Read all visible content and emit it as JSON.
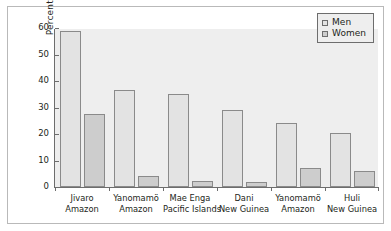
{
  "chart_data": {
    "type": "bar",
    "title": "",
    "xlabel": "",
    "ylabel": "Percentage",
    "ylim": [
      0,
      60
    ],
    "yticks": [
      0,
      10,
      20,
      30,
      40,
      50,
      60
    ],
    "grid": false,
    "legend_position": "top-right",
    "categories": [
      {
        "line1": "Jivaro",
        "line2": "Amazon"
      },
      {
        "line1": "Yanomamö",
        "line2": "Amazon"
      },
      {
        "line1": "Mae Enga",
        "line2": "Pacific Islands"
      },
      {
        "line1": "Dani",
        "line2": "New Guinea"
      },
      {
        "line1": "Yanomamö",
        "line2": "Amazon"
      },
      {
        "line1": "Huli",
        "line2": "New Guinea"
      }
    ],
    "series": [
      {
        "name": "Men",
        "color": "#e3e3e3",
        "values": [
          59,
          36.5,
          35,
          29,
          24,
          20.2
        ]
      },
      {
        "name": "Women",
        "color": "#cdcdcd",
        "values": [
          27.5,
          4.1,
          2.2,
          2,
          7.1,
          6
        ]
      }
    ]
  },
  "legend": {
    "items": [
      {
        "label": "Men",
        "swatch": "men-swatch"
      },
      {
        "label": "Women",
        "swatch": "women-swatch"
      }
    ]
  },
  "axes": {
    "y_label": "Percentage",
    "y_ticks": [
      "0",
      "10",
      "20",
      "30",
      "40",
      "50",
      "60"
    ]
  }
}
